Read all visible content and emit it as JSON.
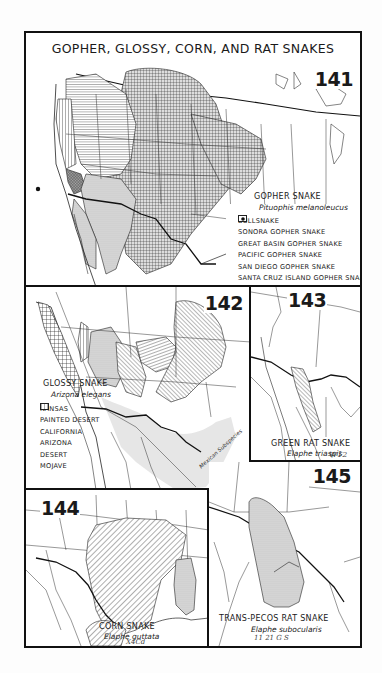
{
  "page": {
    "title": "GOPHER, GLOSSY, CORN, AND RAT SNAKES"
  },
  "maps": {
    "m141": {
      "number": "141",
      "species_common": "GOPHER SNAKE",
      "species_scientific": "Pituophis melanoleucus",
      "region": "Western and central North America",
      "legend": [
        {
          "label": "BULLSNAKE",
          "pattern": "crosshatch-grid"
        },
        {
          "label": "SONORA GOPHER SNAKE",
          "pattern": "fine-dots"
        },
        {
          "label": "GREAT BASIN GOPHER SNAKE",
          "pattern": "diagonal-lines"
        },
        {
          "label": "PACIFIC GOPHER SNAKE",
          "pattern": "vertical-lines"
        },
        {
          "label": "SAN DIEGO GOPHER SNAKE",
          "pattern": "dense-diagonal-crosshatch"
        },
        {
          "label": "SANTA CRUZ ISLAND GOPHER SNAKE",
          "pattern": "solid-dot"
        }
      ]
    },
    "m142": {
      "number": "142",
      "species_common": "GLOSSY SNAKE",
      "species_scientific": "Arizona elegans",
      "annotation": "Mexican Subspecies",
      "legend": [
        {
          "label": "KANSAS",
          "pattern": "diagonal-lines"
        },
        {
          "label": "PAINTED DESERT",
          "pattern": "horizontal-lines"
        },
        {
          "label": "CALIFORNIA",
          "pattern": "grid"
        },
        {
          "label": "ARIZONA",
          "pattern": "back-diagonal-lines"
        },
        {
          "label": "DESERT",
          "pattern": "fine-dots"
        },
        {
          "label": "MOJAVE",
          "pattern": "vertical-lines"
        }
      ]
    },
    "m143": {
      "number": "143",
      "species_common": "GREEN RAT SNAKE",
      "species_scientific": "Elaphe triaspis",
      "scribble": "W12"
    },
    "m144": {
      "number": "144",
      "species_common": "CORN SNAKE",
      "species_scientific": "Elaphe guttata",
      "scribble": "X4Cd"
    },
    "m145": {
      "number": "145",
      "species_common": "TRANS-PECOS RAT SNAKE",
      "species_scientific": "Elaphe subocularis",
      "scribble": "11 21  G S"
    }
  },
  "colors": {
    "ink": "#111111",
    "paper": "#ffffff",
    "shade": "#c9c9c9",
    "hatch": "#333333"
  }
}
